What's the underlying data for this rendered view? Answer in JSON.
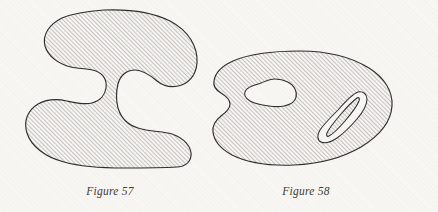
{
  "page": {
    "background_color": "#f8f6f3",
    "ink_color": "#2e2d2b",
    "hatch_color": "#4a4947",
    "width": 438,
    "height": 212
  },
  "figures": [
    {
      "id": "figure-57",
      "caption": "Figure 57",
      "shape_name": "kidney-blob",
      "description": "Simply connected hatched region with two concave notches (left and right)",
      "holes": 0,
      "fill": "diagonal-hatch-45",
      "bounds": {
        "x": 25,
        "y": 10,
        "width": 173,
        "height": 158
      }
    },
    {
      "id": "figure-58",
      "caption": "Figure 58",
      "shape_name": "oval-blob-with-two-holes",
      "description": "Hatched oval region with a small left notch and two unshaded holes",
      "holes": 2,
      "hole_names": [
        "bean-hole",
        "crescent-hole"
      ],
      "fill": "diagonal-hatch-45",
      "bounds": {
        "x": 218,
        "y": 50,
        "width": 175,
        "height": 115
      }
    }
  ],
  "hatching": {
    "angle_degrees": 45,
    "spacing_px": 3,
    "stroke_width_px": 0.55,
    "direction": "lower-left to upper-right"
  }
}
